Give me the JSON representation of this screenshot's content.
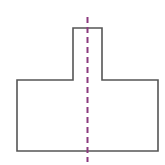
{
  "figure": {
    "shape": {
      "type": "polygon",
      "points": [
        [
          73,
          28
        ],
        [
          102,
          28
        ],
        [
          102,
          80
        ],
        [
          158,
          80
        ],
        [
          158,
          151
        ],
        [
          17,
          151
        ],
        [
          17,
          80
        ],
        [
          73,
          80
        ]
      ],
      "stroke": "#555555",
      "stroke_width": 1.6,
      "fill": "#ffffff"
    },
    "symmetry_line": {
      "x": 87.5,
      "y1": 17,
      "y2": 162,
      "stroke": "#8b3a7e",
      "stroke_width": 2,
      "dash": "6 4"
    }
  }
}
